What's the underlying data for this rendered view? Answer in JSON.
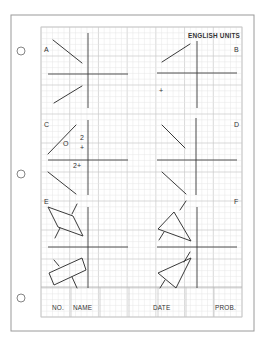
{
  "sheet": {
    "header": "ENGLISH UNITS",
    "colors": {
      "background": "#ffffff",
      "card_border": "#9a9a9a",
      "grid_minor": "#e6e6e6",
      "grid_major": "#c8c8c8",
      "ink": "#3a3a3a"
    },
    "card": {
      "x": 11,
      "y": 15,
      "w": 243,
      "h": 316
    },
    "grid": {
      "x": 41,
      "y": 27,
      "w": 201,
      "h": 290,
      "minor": 5.8,
      "major_every": 5
    },
    "holes": [
      {
        "cx": 21,
        "cy": 51,
        "r": 4
      },
      {
        "cx": 21,
        "cy": 174,
        "r": 4
      },
      {
        "cx": 21,
        "cy": 298,
        "r": 4
      }
    ],
    "panels": [
      {
        "label": "A",
        "label_pos": [
          44,
          52
        ],
        "axes": {
          "v": [
            88,
            33,
            88,
            108
          ],
          "h": [
            48,
            74,
            128,
            74
          ]
        },
        "lines": [
          [
            53,
            40,
            82,
            63
          ],
          [
            54,
            103,
            82,
            86
          ]
        ],
        "polys": [],
        "texts": []
      },
      {
        "label": "B",
        "label_pos": [
          234,
          52
        ],
        "axes": {
          "v": [
            197,
            41,
            197,
            108
          ],
          "h": [
            157,
            73,
            237,
            73
          ]
        },
        "lines": [
          [
            162,
            62,
            190,
            44
          ]
        ],
        "polys": [],
        "texts": [
          {
            "t": "+",
            "x": 159,
            "y": 93
          }
        ]
      },
      {
        "label": "C",
        "label_pos": [
          44,
          127
        ],
        "axes": {
          "v": [
            88,
            120,
            88,
            195
          ],
          "h": [
            48,
            160,
            128,
            160
          ]
        },
        "lines": [
          [
            48,
            154,
            76,
            125
          ],
          [
            48,
            172,
            76,
            194
          ]
        ],
        "polys": [],
        "texts": [
          {
            "t": "O",
            "x": 63,
            "y": 146
          },
          {
            "t": "2",
            "x": 80,
            "y": 140
          },
          {
            "t": "+",
            "x": 80,
            "y": 150
          },
          {
            "t": "2+",
            "x": 73,
            "y": 168
          }
        ]
      },
      {
        "label": "D",
        "label_pos": [
          234,
          127
        ],
        "axes": {
          "v": [
            196,
            118,
            196,
            195
          ],
          "h": [
            157,
            160,
            237,
            160
          ]
        },
        "lines": [
          [
            162,
            125,
            185,
            148
          ],
          [
            162,
            172,
            186,
            194
          ]
        ],
        "polys": [],
        "texts": []
      },
      {
        "label": "E",
        "label_pos": [
          44,
          204
        ],
        "axes": {
          "v": [
            88,
            207,
            88,
            288
          ],
          "h": [
            48,
            247,
            128,
            247
          ]
        },
        "lines": [
          [
            72,
            214,
            77,
            204
          ],
          [
            60,
            228,
            55,
            238
          ],
          [
            59,
            266,
            54,
            260
          ],
          [
            72,
            277,
            77,
            288
          ]
        ],
        "polys": [
          [
            [
              48,
              207
            ],
            [
              73,
              216
            ],
            [
              83,
              236
            ],
            [
              58,
              227
            ]
          ],
          [
            [
              49,
              273
            ],
            [
              82,
              258
            ],
            [
              86,
              270
            ],
            [
              54,
              285
            ]
          ]
        ],
        "texts": []
      },
      {
        "label": "F",
        "label_pos": [
          234,
          204
        ],
        "axes": {
          "v": [
            197,
            207,
            197,
            288
          ],
          "h": [
            157,
            247,
            237,
            247
          ]
        },
        "lines": [
          [
            180,
            210,
            186,
            201
          ],
          [
            164,
            232,
            159,
            240
          ],
          [
            184,
            262,
            190,
            252
          ],
          [
            165,
            280,
            160,
            288
          ]
        ],
        "polys": [
          [
            [
              174,
              212
            ],
            [
              158,
              229
            ],
            [
              191,
              241
            ]
          ],
          [
            [
              191,
              258
            ],
            [
              158,
              273
            ],
            [
              176,
              288
            ]
          ]
        ],
        "texts": []
      }
    ],
    "title_block": {
      "top": 287,
      "dividers": [
        71,
        100,
        129,
        158,
        186,
        214
      ],
      "text_y": 310,
      "fields": [
        {
          "label": "NO.",
          "x": 52
        },
        {
          "label": "NAME",
          "x": 73
        },
        {
          "label": "DATE",
          "x": 153
        },
        {
          "label": "PROB.",
          "x": 215
        }
      ]
    }
  }
}
